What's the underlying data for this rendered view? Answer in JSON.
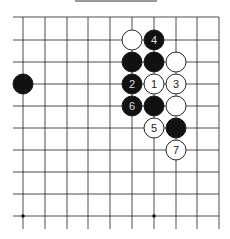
{
  "board": {
    "columns_x": [
      23,
      45,
      67,
      88,
      110,
      132,
      154,
      176,
      197,
      219
    ],
    "rows_y": [
      17,
      40,
      62,
      84,
      106,
      128,
      150,
      172,
      194,
      216
    ],
    "line_color": "#222222",
    "star_points": [
      [
        0,
        9
      ],
      [
        6,
        9
      ]
    ]
  },
  "stones": [
    {
      "col": 5,
      "row": 1,
      "color": "white",
      "label": ""
    },
    {
      "col": 6,
      "row": 1,
      "color": "black",
      "label": "4"
    },
    {
      "col": 5,
      "row": 2,
      "color": "black",
      "label": ""
    },
    {
      "col": 6,
      "row": 2,
      "color": "black",
      "label": ""
    },
    {
      "col": 7,
      "row": 2,
      "color": "white",
      "label": ""
    },
    {
      "col": 0,
      "row": 3,
      "color": "black",
      "label": ""
    },
    {
      "col": 5,
      "row": 3,
      "color": "black",
      "label": "2"
    },
    {
      "col": 6,
      "row": 3,
      "color": "white",
      "label": "1"
    },
    {
      "col": 7,
      "row": 3,
      "color": "white",
      "label": "3"
    },
    {
      "col": 5,
      "row": 4,
      "color": "black",
      "label": "6"
    },
    {
      "col": 6,
      "row": 4,
      "color": "black",
      "label": ""
    },
    {
      "col": 7,
      "row": 4,
      "color": "white",
      "label": ""
    },
    {
      "col": 6,
      "row": 5,
      "color": "white",
      "label": "5"
    },
    {
      "col": 7,
      "row": 5,
      "color": "black",
      "label": ""
    },
    {
      "col": 7,
      "row": 6,
      "color": "white",
      "label": "7"
    }
  ]
}
